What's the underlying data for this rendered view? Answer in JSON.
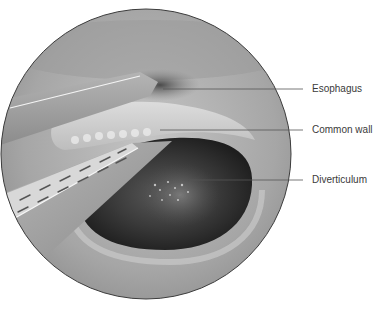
{
  "figure": {
    "labels": [
      {
        "text": "Esophagus",
        "line_y": 89,
        "line_x_start": 163,
        "line_x_end": 303,
        "text_top": 83
      },
      {
        "text": "Common wall",
        "line_y": 130,
        "line_x_start": 160,
        "line_x_end": 303,
        "text_top": 124
      },
      {
        "text": "Diverticulum",
        "line_y": 180,
        "line_x_start": 190,
        "line_x_end": 303,
        "text_top": 174
      }
    ],
    "colors": {
      "background": "#ffffff",
      "circle_border": "#3c3c3c",
      "tissue": "#a8a8a8",
      "cavity": "#2e2e2e",
      "leader_line": "#555555",
      "label_text": "#3a3a3a"
    }
  }
}
